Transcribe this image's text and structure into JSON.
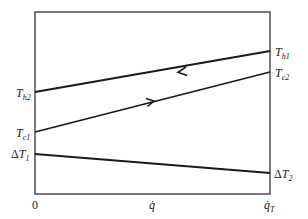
{
  "diagram": {
    "type": "temperature-heat-duty diagram",
    "frame": {
      "x0": 35,
      "y0": 12,
      "x1": 270,
      "y1": 194,
      "color": "#333333"
    },
    "curves": [
      {
        "id": "hot",
        "from_label": "Th2",
        "to_label": "Th1",
        "y_left": 92,
        "y_right": 51,
        "arrow": "left",
        "arrow_x": 180
      },
      {
        "id": "cold",
        "from_label": "Tc1",
        "to_label": "Tc2",
        "y_left": 132,
        "y_right": 72,
        "arrow": "right",
        "arrow_x": 152
      },
      {
        "id": "delta",
        "from_label": "ΔT1",
        "to_label": "ΔT2",
        "y_left": 154,
        "y_right": 173,
        "arrow": "none"
      }
    ],
    "labels": {
      "th2": {
        "main": "T",
        "sub": "h2"
      },
      "th1": {
        "main": "T",
        "sub": "h1"
      },
      "tc1": {
        "main": "T",
        "sub": "c1"
      },
      "tc2": {
        "main": "T",
        "sub": "c2"
      },
      "dt1": {
        "prefix": "Δ",
        "main": "T",
        "sub": "1"
      },
      "dt2": {
        "prefix": "Δ",
        "main": "T",
        "sub": "2"
      }
    },
    "x_axis": {
      "ticks": [
        {
          "label": "0",
          "x": 35
        },
        {
          "label": "q̇",
          "x": 152
        },
        {
          "label": "q̇",
          "sub": "T",
          "x": 270
        }
      ]
    }
  }
}
